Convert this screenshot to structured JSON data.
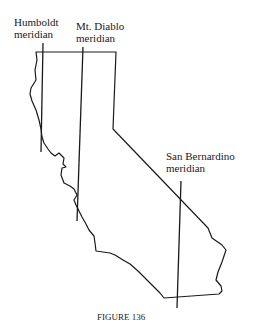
{
  "figure": {
    "caption": "FIGURE 136",
    "labels": {
      "humboldt": {
        "line1": "Humboldt",
        "line2": "meridian"
      },
      "mt_diablo": {
        "line1": "Mt. Diablo",
        "line2": "meridian"
      },
      "san_bernardino": {
        "line1": "San Bernardino",
        "line2": "meridian"
      }
    },
    "meridians": [
      {
        "name": "Humboldt meridian",
        "x1": 43,
        "y1": 43,
        "x2": 41,
        "y2": 152
      },
      {
        "name": "Mt. Diablo meridian",
        "x1": 83,
        "y1": 47,
        "x2": 77,
        "y2": 221
      },
      {
        "name": "San Bernardino meridian",
        "x1": 181,
        "y1": 181,
        "x2": 177,
        "y2": 308
      }
    ],
    "colors": {
      "ink": "#1a1a1a",
      "background": "#ffffff"
    }
  }
}
